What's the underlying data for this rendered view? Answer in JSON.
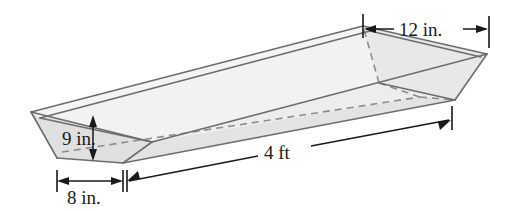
{
  "figure": {
    "name": "trapezoidal-trough-diagram",
    "shape": "trapezoidal prism (trough)",
    "background_color": "#ffffff",
    "fill_colors": {
      "outer_side": "#e6e6e6",
      "inner_side": "#ececec",
      "end_face": "#e2e2e2",
      "rim_band": "#f2f2f2",
      "far_wall": "#efefef"
    },
    "stroke_colors": {
      "solid_edge": "#6d6d6d",
      "hidden_edge": "#8d8d8d",
      "dimension": "#1a1a1a"
    }
  },
  "dimensions": [
    {
      "id": "top-width",
      "label": "12 in.",
      "measures": "top opening width",
      "value": 12,
      "unit": "in.",
      "position": "top-right"
    },
    {
      "id": "depth",
      "label": "9 in.",
      "measures": "trough depth",
      "value": 9,
      "unit": "in.",
      "position": "left-vertical"
    },
    {
      "id": "bottom-width",
      "label": "8 in.",
      "measures": "bottom width",
      "value": 8,
      "unit": "in.",
      "position": "bottom-left"
    },
    {
      "id": "length",
      "label": "4 ft",
      "measures": "trough length",
      "value": 4,
      "unit": "ft",
      "position": "bottom-right"
    }
  ]
}
